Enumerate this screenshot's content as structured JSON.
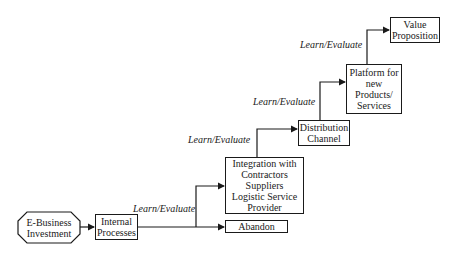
{
  "diagram": {
    "type": "staircase-flow",
    "nodes": {
      "start": "E-Business\nInvestment",
      "internal": "Internal\nProcesses",
      "integration": "Integration with\nContractors\nSuppliers\nLogistic Service\nProvider",
      "abandon": "Abandon",
      "distribution": "Distribution\nChannel",
      "platform": "Platform for\nnew\nProducts/\nServices",
      "value": "Value\nProposition"
    },
    "edge_labels": {
      "l1": "Learn/Evaluate",
      "l2": "Learn/Evaluate",
      "l3": "Learn/Evaluate",
      "l4": "Learn/Evaluate"
    },
    "colors": {
      "line": "#1a1a1a",
      "background": "#ffffff"
    }
  }
}
